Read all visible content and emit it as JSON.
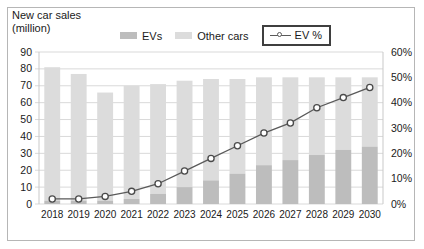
{
  "axis_title": "New car sales\n(million)",
  "legend": [
    {
      "name": "evs",
      "label": "EVs",
      "color": "#bdbdbd",
      "type": "swatch"
    },
    {
      "name": "other-cars",
      "label": "Other cars",
      "color": "#dcdcdc",
      "type": "swatch"
    },
    {
      "name": "ev-percent",
      "label": "EV %",
      "color": "#5a5a5a",
      "type": "line",
      "highlighted": true
    }
  ],
  "colors": {
    "ev_bar": "#bdbdbd",
    "other_bar": "#dcdcdc",
    "line": "#5a5a5a",
    "marker_fill": "#ffffff",
    "grid": "#d9d9d9",
    "frame": "#b6b6b6",
    "legend_box_border": "#3f3f3f",
    "text": "#1a1a1a"
  },
  "chart_data": {
    "type": "bar",
    "title": "New car sales (million)",
    "xlabel": "",
    "ylabel": "New car sales (million)",
    "y2label": "EV %",
    "categories": [
      "2018",
      "2019",
      "2020",
      "2021",
      "2022",
      "2023",
      "2024",
      "2025",
      "2026",
      "2027",
      "2028",
      "2029",
      "2030"
    ],
    "ylim": [
      0,
      90
    ],
    "y2lim": [
      0,
      0.6
    ],
    "yticks": [
      0,
      10,
      20,
      30,
      40,
      50,
      60,
      70,
      80,
      90
    ],
    "ytick_labels": [
      "0",
      "10",
      "20",
      "30",
      "40",
      "50",
      "60",
      "70",
      "80",
      "90"
    ],
    "y2ticks": [
      0,
      10,
      20,
      30,
      40,
      50,
      60
    ],
    "y2tick_labels": [
      "0%",
      "10%",
      "20%",
      "30%",
      "40%",
      "50%",
      "60%"
    ],
    "grid": true,
    "legend_position": "top",
    "stacked": true,
    "series": [
      {
        "name": "EVs",
        "type": "bar",
        "axis": "left",
        "color": "#bdbdbd",
        "values": [
          2,
          2,
          2,
          3,
          6,
          10,
          14,
          18,
          23,
          26,
          29,
          32,
          34
        ]
      },
      {
        "name": "Other cars",
        "type": "bar",
        "axis": "left",
        "color": "#dcdcdc",
        "values": [
          79,
          75,
          64,
          67,
          65,
          63,
          60,
          56,
          52,
          49,
          46,
          43,
          41
        ]
      },
      {
        "name": "EV %",
        "type": "line",
        "axis": "right",
        "color": "#5a5a5a",
        "values": [
          2,
          2,
          3,
          5,
          8,
          13,
          18,
          23,
          28,
          32,
          38,
          42,
          46
        ]
      }
    ],
    "totals": [
      81,
      77,
      66,
      70,
      71,
      73,
      74,
      74,
      75,
      75,
      75,
      75,
      75
    ]
  }
}
